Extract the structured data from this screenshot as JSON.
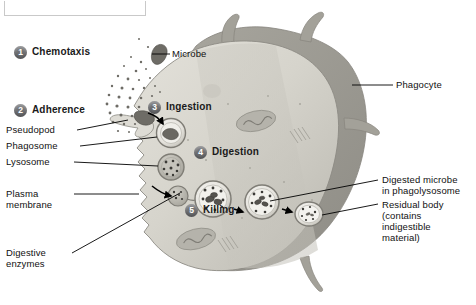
{
  "figure": {
    "background_color": "#ffffff",
    "cell_fill_light": "#d9d7d0",
    "cell_fill_mid": "#bfbdb5",
    "cell_fill_dark": "#9a9890",
    "stepnum_color": "#6f7073",
    "line_color": "#000000"
  },
  "steps": [
    {
      "num": "1",
      "label": "Chemotaxis"
    },
    {
      "num": "2",
      "label": "Adherence"
    },
    {
      "num": "3",
      "label": "Ingestion"
    },
    {
      "num": "4",
      "label": "Digestion"
    },
    {
      "num": "5",
      "label": "Killing"
    }
  ],
  "labels": {
    "microbe": "Microbe",
    "phagocyte": "Phagocyte",
    "pseudopod": "Pseudopod",
    "phagosome": "Phagosome",
    "lysosome": "Lysosome",
    "plasma_membrane_l1": "Plasma",
    "plasma_membrane_l2": "membrane",
    "digestive_enzymes_l1": "Digestive",
    "digestive_enzymes_l2": "enzymes",
    "digested_microbe_l1": "Digested microbe",
    "digested_microbe_l2": "in phagolysosome",
    "residual_body_l1": "Residual body",
    "residual_body_l2": "(contains",
    "residual_body_l3": "indigestible",
    "residual_body_l4": "material)"
  }
}
